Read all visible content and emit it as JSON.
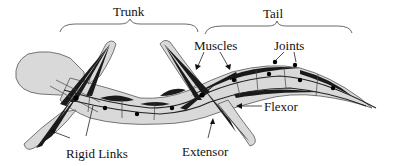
{
  "labels": {
    "trunk": "Trunk",
    "tail": "Tail",
    "muscles": "Muscles",
    "joints": "Joints",
    "flexor": "Flexor",
    "extensor": "Extensor",
    "rigid_links": "Rigid Links"
  },
  "colors": {
    "body_fill": "#d9d9d9",
    "muscle": "#1a1a1a",
    "outline": "#555555"
  }
}
